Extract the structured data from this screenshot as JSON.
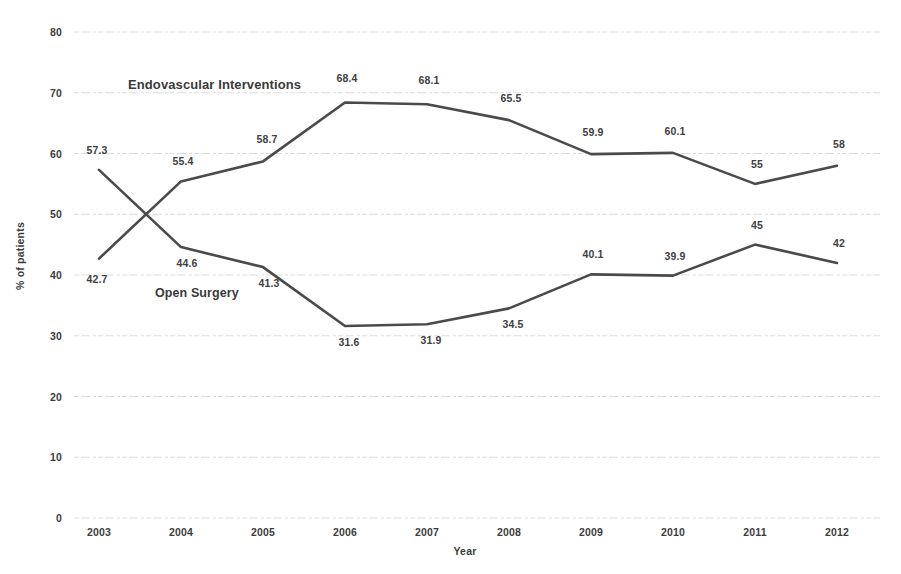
{
  "chart_data": {
    "type": "line",
    "title": "",
    "xlabel": "Year",
    "ylabel": "% of patients",
    "categories": [
      "2003",
      "2004",
      "2005",
      "2006",
      "2007",
      "2008",
      "2009",
      "2010",
      "2011",
      "2012"
    ],
    "x": [
      2003,
      2004,
      2005,
      2006,
      2007,
      2008,
      2009,
      2010,
      2011,
      2012
    ],
    "ylim": [
      0,
      80
    ],
    "yticks": [
      80,
      70,
      60,
      50,
      40,
      30,
      20,
      10,
      0
    ],
    "ytick_labels": [
      "80",
      "70",
      "60",
      "50",
      "40",
      "30",
      "20",
      "10",
      "0"
    ],
    "grid": true,
    "grid_axis": "y",
    "legend_position": "inline-annotation",
    "series": [
      {
        "name": "Endovascular Interventions",
        "values": [
          42.7,
          55.4,
          58.7,
          68.4,
          68.1,
          65.5,
          59.9,
          60.1,
          55,
          58
        ],
        "value_labels": [
          "42.7",
          "55.4",
          "58.7",
          "68.4",
          "68.1",
          "65.5",
          "59.9",
          "60.1",
          "55",
          "58"
        ],
        "color": "#4a4a4a"
      },
      {
        "name": "Open Surgery",
        "values": [
          57.3,
          44.6,
          41.3,
          31.6,
          31.9,
          34.5,
          40.1,
          39.9,
          45,
          42
        ],
        "value_labels": [
          "57.3",
          "44.6",
          "41.3",
          "31.6",
          "31.9",
          "34.5",
          "40.1",
          "39.9",
          "45",
          "42"
        ],
        "color": "#4a4a4a"
      }
    ],
    "annotations": [
      {
        "text": "Endovascular Interventions",
        "series": "Endovascular Interventions"
      },
      {
        "text": "Open Surgery",
        "series": "Open Surgery"
      }
    ]
  },
  "colors": {
    "line": "#4a4a4a",
    "grid": "#dcdcdc",
    "text": "#3c3c3c",
    "background": "#ffffff"
  }
}
